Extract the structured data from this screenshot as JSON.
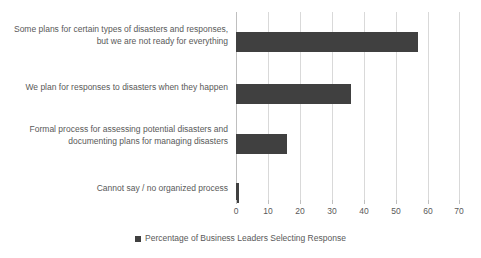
{
  "chart_data": {
    "type": "bar",
    "orientation": "horizontal",
    "title": "",
    "subtitle": "",
    "xlabel": "",
    "ylabel": "",
    "xlim": [
      0,
      70
    ],
    "xticks": [
      0,
      10,
      20,
      30,
      40,
      50,
      60,
      70
    ],
    "xtick_labels": [
      "0",
      "10",
      "20",
      "30",
      "40",
      "50",
      "60",
      "70"
    ],
    "grid": true,
    "grid_axis": "x",
    "legend_position": "bottom",
    "legend": [
      "Percentage of Business Leaders Selecting Response"
    ],
    "categories": [
      "Some plans for certain types of disasters and responses, but we are not ready for everything",
      "We plan for responses to disasters when they happen",
      "Formal process for assessing potential disasters and documenting plans for managing disasters",
      "Cannot say / no organized process"
    ],
    "series": [
      {
        "name": "Percentage of Business Leaders Selecting Response",
        "color": "#404040",
        "values": [
          57,
          36,
          16,
          1
        ]
      }
    ],
    "colors": {
      "bar": "#404040",
      "gridline": "#d9d9d9",
      "axis": "#bfbfbf",
      "text": "#595959",
      "background": "#ffffff"
    }
  },
  "legend": {
    "marker_name": "square-marker",
    "label": "Percentage of Business Leaders Selecting Response"
  }
}
